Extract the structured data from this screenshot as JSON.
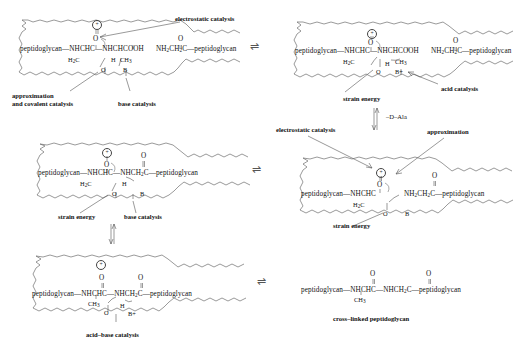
{
  "diagram": {
    "enzyme_charge_symbol": "+",
    "equilibrium_arrow": "⇌"
  },
  "panels": [
    {
      "id": "top-left",
      "position": "top-left",
      "substrate_left": "peptidoglycan—NHCHC—NHCHCOOH",
      "substrate_right": "NH",
      "substrate_right_sub1": "2",
      "substrate_right_mid": "CH",
      "substrate_right_sub2": "2",
      "substrate_right_tail": "C—peptidoglycan",
      "carbonyl_o": "O",
      "h2c": "H",
      "h2c_sub": "2",
      "h2c_tail": "C",
      "ch3": "CH",
      "ch3_sub": "3",
      "ser_o": "O",
      "ser_h": "H",
      "base": "B",
      "labels": [
        {
          "name": "electrostatic-catalysis",
          "text": "electrostatic catalysis"
        },
        {
          "name": "approximation-covalent",
          "text": "approximation"
        },
        {
          "name": "approximation-covalent-2",
          "text": "and covalent catalysis"
        },
        {
          "name": "base-catalysis",
          "text": "base catalysis"
        }
      ]
    },
    {
      "id": "top-right",
      "position": "top-right",
      "substrate_left": "peptidoglycan—NHCHC—NHCHCOOH",
      "substrate_right": "NH",
      "substrate_right_sub1": "2",
      "substrate_right_mid": "CH",
      "substrate_right_sub2": "2",
      "substrate_right_tail": "C—peptidoglycan",
      "carbonyl_o": "O",
      "h2c": "H",
      "h2c_sub": "2",
      "h2c_tail": "C",
      "ch3": "CH",
      "ch3_sub": "3",
      "ser_o": "O",
      "ser_h": "H",
      "base": "B+",
      "labels": [
        {
          "name": "strain-energy",
          "text": "strain energy"
        },
        {
          "name": "acid-catalysis",
          "text": "acid catalysis"
        }
      ]
    },
    {
      "id": "middle-left",
      "position": "middle-left",
      "substrate": "peptidoglycan—NHCHC—NHCH",
      "substrate_sub": "2",
      "substrate_tail": "C—peptidoglycan",
      "carbonyl_o_left": "O",
      "carbonyl_o_right": "O",
      "h2c": "H",
      "h2c_sub": "2",
      "h2c_tail": "C",
      "amide_h": "H",
      "ser_o": "O",
      "base": "B",
      "labels": [
        {
          "name": "strain-energy",
          "text": "strain energy"
        },
        {
          "name": "base-catalysis",
          "text": "base catalysis"
        }
      ]
    },
    {
      "id": "middle-right",
      "position": "middle-right",
      "substrate_left": "peptidoglycan—NHCHC",
      "substrate_right": "NH",
      "substrate_right_sub1": "2",
      "substrate_right_mid": "CH",
      "substrate_right_sub2": "2",
      "substrate_right_tail": "C—peptidoglycan",
      "carbonyl_o": "O",
      "acyl_o": "O",
      "h2c": "H",
      "h2c_sub": "2",
      "h2c_tail": "C",
      "ser_o": "O",
      "base": "B",
      "labels": [
        {
          "name": "electrostatic-catalysis",
          "text": "electrostatic catalysis"
        },
        {
          "name": "approximation",
          "text": "approximation"
        },
        {
          "name": "strain-energy",
          "text": "strain energy"
        }
      ]
    },
    {
      "id": "bottom-left",
      "position": "bottom-left",
      "substrate": "peptidoglycan—NHCHC—NHCH",
      "substrate_sub": "2",
      "substrate_tail": "C—peptidoglycan",
      "carbonyl_o_left": "O",
      "carbonyl_o_right": "O",
      "ch3": "CH",
      "ch3_sub": "3",
      "ser_o": "O",
      "ser_h": "H",
      "base": "B+",
      "labels": [
        {
          "name": "acid-base-catalysis",
          "text": "acid–base catalysis"
        }
      ]
    },
    {
      "id": "bottom-right",
      "position": "bottom-right",
      "substrate": "peptidoglycan—NHCHC—NHCH",
      "substrate_sub": "2",
      "substrate_tail": "C—peptidoglycan",
      "carbonyl_o_left": "O",
      "carbonyl_o_right": "O",
      "ch3": "CH",
      "ch3_sub": "3",
      "labels": [
        {
          "name": "product-caption",
          "text": "cross–linked peptidoglycan"
        }
      ]
    }
  ],
  "reaction_labels": {
    "d_ala_loss": "–D–Ala"
  }
}
